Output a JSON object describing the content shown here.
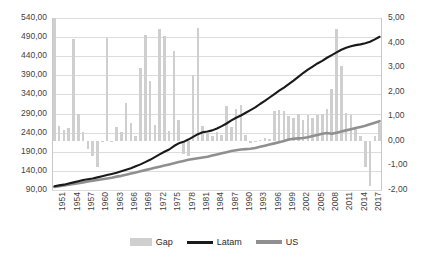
{
  "chart_data": {
    "type": "bar",
    "title": "",
    "subtitle": "",
    "xlabel": "",
    "ylabel": "",
    "y2label": "",
    "grid": true,
    "legend_position": "bottom",
    "ylim": [
      90,
      540
    ],
    "y_ticks": [
      "90,00",
      "140,00",
      "190,00",
      "240,00",
      "290,00",
      "340,00",
      "390,00",
      "440,00",
      "490,00",
      "540,00"
    ],
    "y2lim": [
      -2,
      5
    ],
    "y2_ticks": [
      "-2,00",
      "-1,00",
      "0,00",
      "1,00",
      "2,00",
      "3,00",
      "4,00",
      "5,00"
    ],
    "x_tick_labels": [
      "1951",
      "1954",
      "1957",
      "1960",
      "1963",
      "1966",
      "1969",
      "1972",
      "1975",
      "1978",
      "1981",
      "1984",
      "1987",
      "1990",
      "1993",
      "1996",
      "1999",
      "2002",
      "2005",
      "2008",
      "2011",
      "2014",
      "2017"
    ],
    "x_tick_step": 3,
    "x": [
      1951,
      1952,
      1953,
      1954,
      1955,
      1956,
      1957,
      1958,
      1959,
      1960,
      1961,
      1962,
      1963,
      1964,
      1965,
      1966,
      1967,
      1968,
      1969,
      1970,
      1971,
      1972,
      1973,
      1974,
      1975,
      1976,
      1977,
      1978,
      1979,
      1980,
      1981,
      1982,
      1983,
      1984,
      1985,
      1986,
      1987,
      1988,
      1989,
      1990,
      1991,
      1992,
      1993,
      1994,
      1995,
      1996,
      1997,
      1998,
      1999,
      2000,
      2001,
      2002,
      2003,
      2004,
      2005,
      2006,
      2007,
      2008,
      2009,
      2010,
      2011,
      2012,
      2013,
      2014,
      2015,
      2016,
      2017,
      2018,
      2019
    ],
    "series": [
      {
        "name": "Gap",
        "type": "bar",
        "axis": "right",
        "color": "#cfcfcf",
        "values": [
          5.25,
          0.6,
          0.45,
          0.52,
          4.15,
          1.1,
          0.35,
          -0.35,
          -0.6,
          -1.05,
          0.0,
          4.2,
          -0.05,
          0.55,
          0.35,
          1.55,
          0.72,
          0.18,
          2.95,
          4.3,
          2.45,
          0.65,
          4.55,
          4.25,
          0.4,
          3.65,
          0.85,
          -0.55,
          -0.6,
          2.7,
          4.6,
          0.6,
          0.3,
          0.2,
          0.35,
          0.25,
          1.4,
          0.55,
          1.3,
          1.45,
          0.25,
          -0.1,
          -0.05,
          0.05,
          0.1,
          0.08,
          1.2,
          1.25,
          1.2,
          1.0,
          0.95,
          1.1,
          0.85,
          1.05,
          0.95,
          1.05,
          1.1,
          1.3,
          2.1,
          4.55,
          3.05,
          1.15,
          1.05,
          0.55,
          0.2,
          -1.05,
          -1.85,
          0.2,
          0.72
        ]
      },
      {
        "name": "Latam",
        "type": "line",
        "axis": "left",
        "color": "#1a1a1a",
        "values": [
          100,
          102,
          104,
          107,
          110,
          113,
          116,
          118,
          120,
          123,
          126,
          129,
          132,
          135,
          139,
          143,
          147,
          152,
          157,
          163,
          169,
          176,
          183,
          190,
          196,
          205,
          212,
          216,
          222,
          229,
          236,
          241,
          243,
          246,
          251,
          257,
          264,
          272,
          279,
          285,
          292,
          299,
          306,
          315,
          323,
          332,
          341,
          350,
          358,
          367,
          376,
          386,
          396,
          405,
          413,
          421,
          428,
          436,
          443,
          450,
          457,
          462,
          466,
          469,
          471,
          474,
          478,
          484,
          491
        ]
      },
      {
        "name": "US",
        "type": "line",
        "axis": "left",
        "color": "#8f8f8f",
        "values": [
          98,
          100,
          102,
          104,
          106,
          108,
          110,
          112,
          114,
          116,
          118,
          120,
          122,
          125,
          127,
          130,
          133,
          136,
          139,
          142,
          145,
          148,
          151,
          154,
          157,
          160,
          163,
          166,
          169,
          171,
          173,
          175,
          177,
          180,
          183,
          186,
          189,
          192,
          194,
          196,
          197,
          198,
          200,
          203,
          206,
          209,
          212,
          215,
          218,
          222,
          224,
          225,
          226,
          228,
          231,
          234,
          237,
          239,
          237,
          240,
          243,
          246,
          249,
          252,
          255,
          258,
          262,
          266,
          270
        ]
      }
    ],
    "legend": [
      {
        "label": "Gap",
        "swatch": "bar-swatch",
        "color": "#cfcfcf"
      },
      {
        "label": "Latam",
        "swatch": "line-swatch",
        "color": "#1a1a1a"
      },
      {
        "label": "US",
        "swatch": "line-swatch",
        "color": "#8f8f8f"
      }
    ]
  }
}
